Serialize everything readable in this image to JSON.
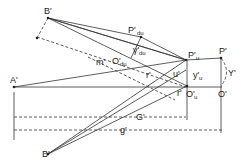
{
  "diagram": {
    "title": "",
    "labels": {
      "B_top": "B'",
      "B_bottom": "B'",
      "A": "A'",
      "P_du": "P'",
      "P_du_sub": "du",
      "gamma_du": "γ'",
      "gamma_du_sub": "du",
      "O_du": "O'",
      "O_du_sub": "du",
      "P_u": "P'",
      "P_u_sub": "u",
      "O_u": "O'",
      "O_u_sub": "u",
      "P": "P'",
      "O": "O'",
      "u": "u'",
      "y_u": "y'",
      "y_u_sub": "u",
      "Y": "Y'",
      "m": "m'",
      "r": "r'",
      "r2": "r'",
      "G": "G'",
      "g": "g'"
    }
  }
}
